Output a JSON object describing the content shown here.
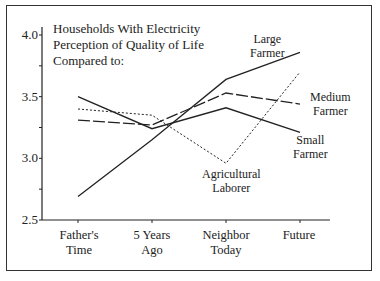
{
  "chart_data": {
    "type": "line",
    "title": "Households With Electricity Perception of Quality of Life Compared to:",
    "title_lines": [
      "Households With Electricity",
      "Perception of Quality of Life",
      "Compared to:"
    ],
    "xlabel": "",
    "ylabel": "",
    "ylim": [
      2.5,
      4.0
    ],
    "yticks": [
      "4.0",
      "3.5",
      "3.0",
      "2.5"
    ],
    "categories": [
      "Father's Time",
      "5 Years Ago",
      "Neighbor Today",
      "Future"
    ],
    "category_lines": [
      [
        "Father's",
        "Time"
      ],
      [
        "5 Years",
        "Ago"
      ],
      [
        "Neighbor",
        "Today"
      ],
      [
        "Future",
        ""
      ]
    ],
    "grid": false,
    "legend_position": "inline labels",
    "series": [
      {
        "name": "Large Farmer",
        "label_lines": [
          "Large",
          "Farmer"
        ],
        "style": "solid",
        "values": [
          2.69,
          3.15,
          3.64,
          3.86
        ]
      },
      {
        "name": "Medium Farmer",
        "label_lines": [
          "Medium",
          "Farmer"
        ],
        "style": "long-dash",
        "values": [
          3.31,
          3.27,
          3.53,
          3.44
        ]
      },
      {
        "name": "Small Farmer",
        "label_lines": [
          "Small",
          "Farmer"
        ],
        "style": "solid",
        "values": [
          3.5,
          3.24,
          3.41,
          3.21
        ]
      },
      {
        "name": "Agricultural Laborer",
        "label_lines": [
          "Agricultural",
          "Laborer"
        ],
        "style": "dotted",
        "values": [
          3.4,
          3.35,
          2.96,
          3.7
        ]
      }
    ]
  }
}
